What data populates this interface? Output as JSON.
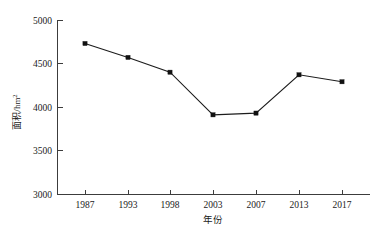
{
  "chart_data": {
    "type": "line",
    "title": "",
    "subtitle": "",
    "xlabel": "年份",
    "ylabel": "面积/hm²",
    "ylabel_base": "面积/hm",
    "ylabel_sup": "2",
    "categories": [
      "1987",
      "1993",
      "1998",
      "2003",
      "2007",
      "2013",
      "2017"
    ],
    "x": [
      1987,
      1993,
      1998,
      2003,
      2007,
      2013,
      2017
    ],
    "values": [
      4730,
      4570,
      4400,
      3910,
      3930,
      4370,
      4290
    ],
    "series": [
      {
        "name": "面积",
        "values": [
          4730,
          4570,
          4400,
          3910,
          3930,
          4370,
          4290
        ]
      }
    ],
    "ylim": [
      3000,
      5000
    ],
    "ytick_labels": [
      "3000",
      "3500",
      "4000",
      "4500",
      "5000"
    ],
    "yticks": [
      3000,
      3500,
      4000,
      4500,
      5000
    ],
    "grid": false,
    "legend": false,
    "legend_position": "none",
    "marker": "square",
    "line_color": "#1c1c1c",
    "marker_color": "#111111",
    "axis_color": "#3c3c3c",
    "background_color": "#ffffff"
  },
  "geometry": {
    "plot_left": 57,
    "plot_right": 370,
    "plot_top": 20,
    "plot_bottom": 194,
    "x_positions": [
      85,
      128,
      170,
      213,
      256,
      299,
      342
    ],
    "y_tick_positions": [
      194,
      150.5,
      107,
      63.5,
      20
    ]
  }
}
